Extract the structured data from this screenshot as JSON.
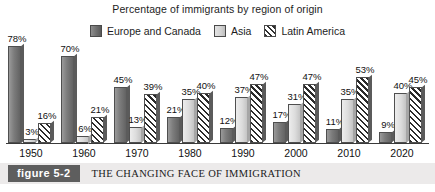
{
  "chart_data": {
    "type": "bar",
    "title": "Percentage of immigrants by region of origin",
    "xlabel": "",
    "ylabel": "",
    "ylim": [
      0,
      80
    ],
    "grid": false,
    "legend_position": "top-center",
    "categories": [
      "1950",
      "1960",
      "1970",
      "1980",
      "1990",
      "2000",
      "2010",
      "2020"
    ],
    "series": [
      {
        "name": "Europe and Canada",
        "color": "#7c7c7c",
        "pattern": "solid-dark-gray",
        "values": [
          78,
          70,
          45,
          21,
          12,
          17,
          11,
          9
        ],
        "labels": [
          "78%",
          "70%",
          "45%",
          "21%",
          "12%",
          "17%",
          "11%",
          "9%"
        ]
      },
      {
        "name": "Asia",
        "color": "#dcdcdc",
        "pattern": "solid-light-gray",
        "values": [
          3,
          6,
          13,
          35,
          37,
          31,
          35,
          40
        ],
        "labels": [
          "3%",
          "6%",
          "13%",
          "35%",
          "37%",
          "31%",
          "35%",
          "40%"
        ]
      },
      {
        "name": "Latin America",
        "color": "#2b2b2b",
        "pattern": "diagonal-hatch",
        "values": [
          16,
          21,
          39,
          40,
          47,
          47,
          53,
          45
        ],
        "labels": [
          "16%",
          "21%",
          "39%",
          "40%",
          "47%",
          "47%",
          "53%",
          "45%"
        ]
      }
    ]
  },
  "legend": {
    "items": [
      {
        "label": "Europe and Canada",
        "swatch": "europe-swatch"
      },
      {
        "label": "Asia",
        "swatch": "asia-swatch"
      },
      {
        "label": "Latin America",
        "swatch": "latin-america-swatch"
      }
    ]
  },
  "caption": {
    "badge": "figure 5-2",
    "text": "THE CHANGING FACE OF IMMIGRATION"
  }
}
